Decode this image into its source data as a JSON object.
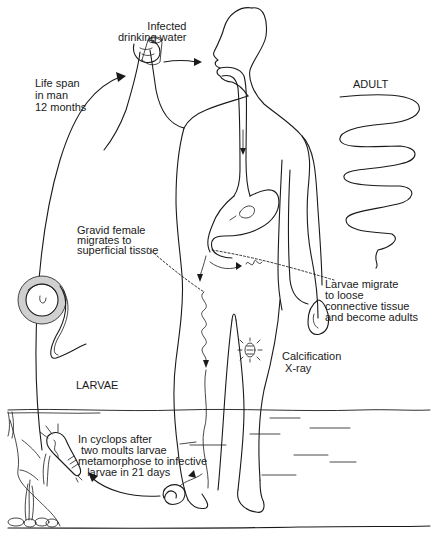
{
  "diagram": {
    "labels": {
      "infected_water": "Infected\ndrinking water",
      "life_span": "Life span\nin man\n12 months",
      "adult": "ADULT",
      "gravid_female": "Gravid female\nmigrates to\nsuperficial tissue",
      "larvae_migrate": "Larvae migrate\nto loose\nconnective tissue\nand become adults",
      "larvae": "LARVAE",
      "calcification": "Calcification\n X-ray",
      "cyclops": "In cyclops after\n two moults larvae\nmetamorphose to infective\n   larvae in 21 days"
    },
    "icons": [
      "human-figure-icon",
      "drinking-cup-icon",
      "adult-worm-icon",
      "larva-coiled-icon",
      "cyclops-copepod-icon",
      "calcified-worm-icon",
      "water-surface-icon",
      "rocks-icon",
      "arrow-icon"
    ],
    "colors": {
      "ink": "#1a1a1a",
      "background": "#ffffff"
    }
  }
}
